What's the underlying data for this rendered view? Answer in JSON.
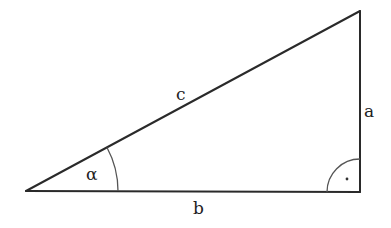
{
  "diagram": {
    "type": "right-triangle",
    "colors": {
      "background": "#ffffff",
      "stroke": "#2a2a2a",
      "arc": "#555555"
    },
    "vertices": {
      "left": {
        "x": 26,
        "y": 191
      },
      "right": {
        "x": 360,
        "y": 192
      },
      "top": {
        "x": 360,
        "y": 11
      }
    },
    "labels": {
      "hypotenuse": "c",
      "opposite": "a",
      "adjacent": "b",
      "angle": "α",
      "right_angle_marker": "·"
    }
  }
}
